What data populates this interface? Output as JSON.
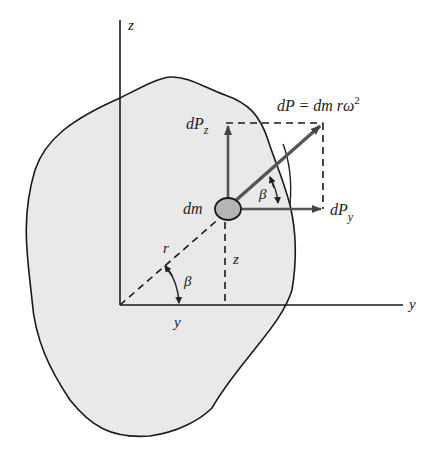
{
  "diagram": {
    "axes": {
      "z_label": "z",
      "y_label": "y"
    },
    "mass_element_label": "dm",
    "force_total": {
      "label_main": "dP = dm rω",
      "label_exp": "2"
    },
    "force_z": {
      "label_main": "dP",
      "label_sub": "z"
    },
    "force_y": {
      "label_main": "dP",
      "label_sub": "y"
    },
    "radius_label": "r",
    "angle_label_origin": "β",
    "angle_label_mass": "β",
    "distance_z_label": "z",
    "distance_y_label": "y",
    "colors": {
      "body_fill": "#e9e9e9",
      "mass_fill": "#b5b5b5",
      "vector": "#555555",
      "line": "#1a1a1a"
    }
  }
}
